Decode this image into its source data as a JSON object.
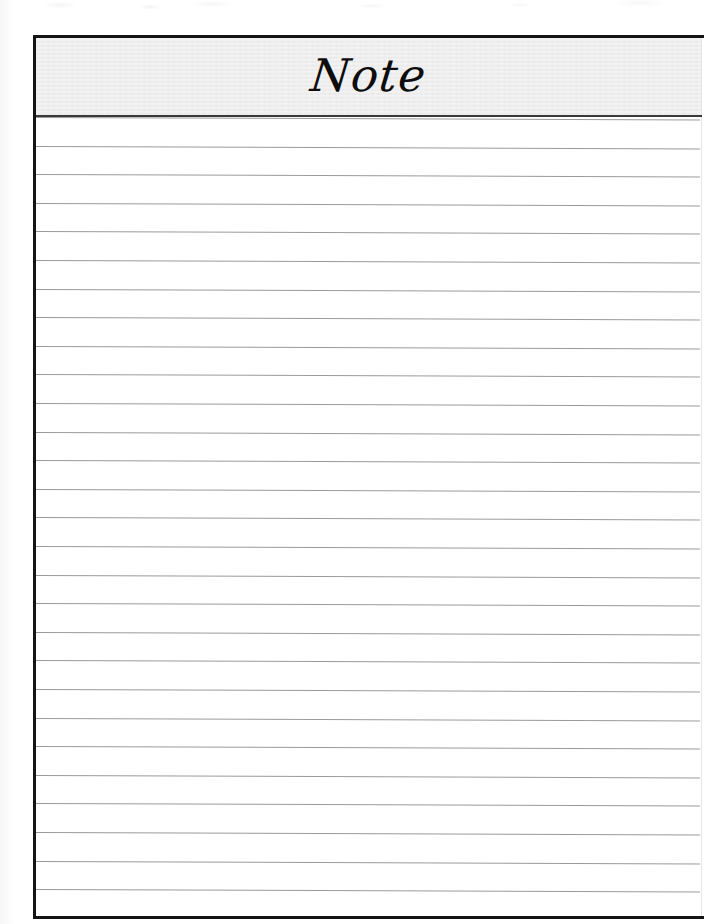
{
  "document": {
    "kind": "lined-note-page",
    "title": "Note",
    "paper_color": "#ffffff",
    "header_band_color": "#ececec",
    "border_color": "#141414",
    "rule_line_color": "#9a9a9a",
    "title_color": "#0d0d0d"
  },
  "header": {
    "title": "Note"
  },
  "body": {
    "line_count": 28,
    "line_spacing_px": 28.6,
    "lines": [
      {
        "index": 1,
        "text": ""
      },
      {
        "index": 2,
        "text": ""
      },
      {
        "index": 3,
        "text": ""
      },
      {
        "index": 4,
        "text": ""
      },
      {
        "index": 5,
        "text": ""
      },
      {
        "index": 6,
        "text": ""
      },
      {
        "index": 7,
        "text": ""
      },
      {
        "index": 8,
        "text": ""
      },
      {
        "index": 9,
        "text": ""
      },
      {
        "index": 10,
        "text": ""
      },
      {
        "index": 11,
        "text": ""
      },
      {
        "index": 12,
        "text": ""
      },
      {
        "index": 13,
        "text": ""
      },
      {
        "index": 14,
        "text": ""
      },
      {
        "index": 15,
        "text": ""
      },
      {
        "index": 16,
        "text": ""
      },
      {
        "index": 17,
        "text": ""
      },
      {
        "index": 18,
        "text": ""
      },
      {
        "index": 19,
        "text": ""
      },
      {
        "index": 20,
        "text": ""
      },
      {
        "index": 21,
        "text": ""
      },
      {
        "index": 22,
        "text": ""
      },
      {
        "index": 23,
        "text": ""
      },
      {
        "index": 24,
        "text": ""
      },
      {
        "index": 25,
        "text": ""
      },
      {
        "index": 26,
        "text": ""
      },
      {
        "index": 27,
        "text": ""
      },
      {
        "index": 28,
        "text": ""
      }
    ]
  }
}
